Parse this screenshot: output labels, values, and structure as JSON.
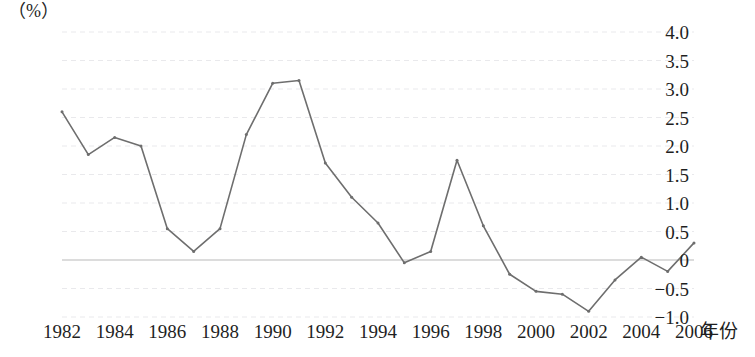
{
  "chart_data": {
    "type": "line",
    "title": "",
    "xlabel": "年份",
    "ylabel": "",
    "unit_label": "（%）",
    "x": [
      1982,
      1983,
      1984,
      1985,
      1986,
      1987,
      1988,
      1989,
      1990,
      1991,
      1992,
      1993,
      1994,
      1995,
      1996,
      1997,
      1998,
      1999,
      2000,
      2001,
      2002,
      2003,
      2004,
      2005,
      2006
    ],
    "values": [
      2.6,
      1.85,
      2.15,
      2.0,
      0.55,
      0.15,
      0.55,
      2.2,
      3.1,
      3.15,
      1.7,
      1.1,
      0.65,
      -0.05,
      0.15,
      1.75,
      0.6,
      -0.25,
      -0.55,
      -0.6,
      -0.9,
      -0.35,
      0.05,
      -0.2,
      0.3
    ],
    "series": [
      {
        "name": "",
        "values": [
          2.6,
          1.85,
          2.15,
          2.0,
          0.55,
          0.15,
          0.55,
          2.2,
          3.1,
          3.15,
          1.7,
          1.1,
          0.65,
          -0.05,
          0.15,
          1.75,
          0.6,
          -0.25,
          -0.55,
          -0.6,
          -0.9,
          -0.35,
          0.05,
          -0.2,
          0.3
        ]
      }
    ],
    "ylim": [
      -1.0,
      4.0
    ],
    "xlim": [
      1982,
      2006
    ],
    "y_ticks": [
      4.0,
      3.5,
      3.0,
      2.5,
      2.0,
      1.5,
      1.0,
      0.5,
      0,
      -0.5,
      -1.0
    ],
    "y_tick_labels": [
      "4.0",
      "3.5",
      "3.0",
      "2.5",
      "2.0",
      "1.5",
      "1.0",
      "0.5",
      "0",
      "-0.5",
      "-1.0"
    ],
    "x_ticks": [
      1982,
      1984,
      1986,
      1988,
      1990,
      1992,
      1994,
      1996,
      1998,
      2000,
      2002,
      2004,
      2006
    ],
    "x_tick_labels": [
      "1982",
      "1984",
      "1986",
      "1988",
      "1990",
      "1992",
      "1994",
      "1996",
      "1998",
      "2000",
      "2002",
      "2004",
      "2006"
    ],
    "grid": true,
    "grid_style": "dashed",
    "legend": "none",
    "line_color": "#6e6e6e",
    "zero_line_color": "#b9b9b9",
    "grid_color": "#e9e9ec",
    "marker": "dot"
  }
}
